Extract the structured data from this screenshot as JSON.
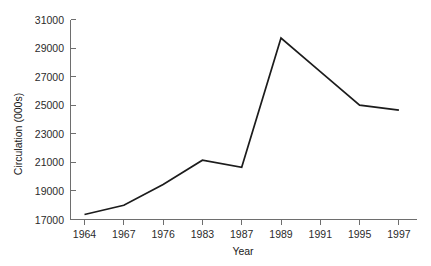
{
  "chart_data": {
    "type": "line",
    "title": "",
    "xlabel": "Year",
    "ylabel": "Circulation (000s)",
    "categories": [
      "1964",
      "1967",
      "1976",
      "1983",
      "1987",
      "1989",
      "1991",
      "1995",
      "1997"
    ],
    "x_tick_labels": [
      "1964",
      "1967",
      "1976",
      "1983",
      "1987",
      "1989",
      "1991",
      "1995",
      "1997"
    ],
    "y_tick_labels": [
      "17000",
      "19000",
      "21000",
      "23000",
      "25000",
      "27000",
      "29000",
      "31000"
    ],
    "y_ticks": [
      17000,
      19000,
      21000,
      23000,
      25000,
      27000,
      29000,
      31000
    ],
    "ylim": [
      17000,
      31000
    ],
    "grid": false,
    "legend": null,
    "series": [
      {
        "name": "Circulation",
        "color": "#1c1c1c",
        "values": [
          17350,
          18000,
          19450,
          21150,
          20650,
          29700,
          27350,
          25000,
          24650
        ]
      }
    ]
  },
  "axes": {
    "y_axis_title": "Circulation (000s)",
    "x_axis_title": "Year"
  },
  "colors": {
    "line": "#1c1c1c",
    "axis": "#6e6e6e",
    "background": "#ffffff",
    "text": "#1a1a1a"
  }
}
